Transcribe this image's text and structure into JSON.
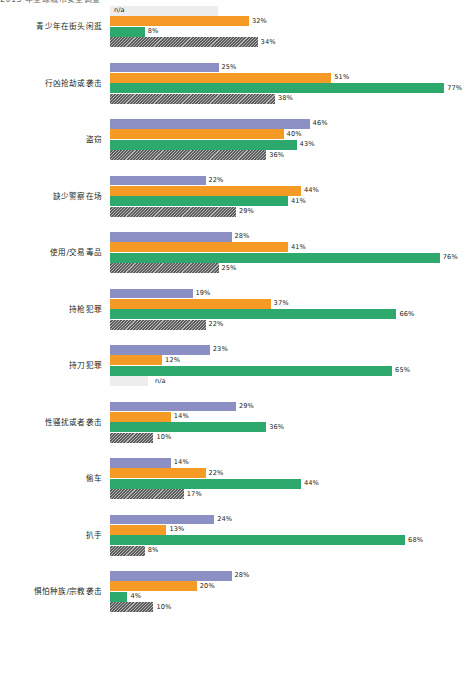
{
  "top_caption": "2013 年全球城市安全调查",
  "chart_data": {
    "type": "bar",
    "orientation": "horizontal-grouped",
    "title": "",
    "subtitle": "",
    "xlabel": "",
    "ylabel": "",
    "xlim": [
      0,
      80
    ],
    "grid": false,
    "legend_position": "none",
    "value_suffix": "%",
    "na_label": "n/a",
    "series": [
      {
        "name": "series-1",
        "color": "#8b8fc4",
        "style": "solid",
        "values": [
          null,
          25,
          46,
          22,
          28,
          19,
          23,
          29,
          14,
          24,
          28
        ]
      },
      {
        "name": "series-2",
        "color": "#f59a25",
        "style": "solid",
        "values": [
          32,
          51,
          40,
          44,
          41,
          37,
          12,
          14,
          22,
          13,
          20
        ]
      },
      {
        "name": "series-3",
        "color": "#2ea96e",
        "style": "solid",
        "values": [
          8,
          77,
          43,
          41,
          76,
          66,
          65,
          36,
          44,
          68,
          4
        ]
      },
      {
        "name": "series-4",
        "color": "#5d5d5d",
        "style": "hatched",
        "values": [
          34,
          38,
          36,
          29,
          25,
          22,
          null,
          10,
          17,
          8,
          10
        ]
      }
    ],
    "categories": [
      "青少年在街头闲逛",
      "行凶抢劫或袭击",
      "盗窃",
      "缺少警察在场",
      "使用/交易毒品",
      "持枪犯罪",
      "持刀犯罪",
      "性骚扰或者袭击",
      "偷车",
      "扒手",
      "惧怕种族/宗教袭击"
    ],
    "labels": [
      [
        "n/a",
        "32%",
        "8%",
        "34%"
      ],
      [
        "25%",
        "51%",
        "77%",
        "38%"
      ],
      [
        "46%",
        "40%",
        "43%",
        "36%"
      ],
      [
        "22%",
        "44%",
        "41%",
        "29%"
      ],
      [
        "28%",
        "41%",
        "76%",
        "25%"
      ],
      [
        "19%",
        "37%",
        "66%",
        "22%"
      ],
      [
        "23%",
        "12%",
        "65%",
        "n/a"
      ],
      [
        "29%",
        "14%",
        "36%",
        "10%"
      ],
      [
        "14%",
        "22%",
        "44%",
        "17%"
      ],
      [
        "24%",
        "13%",
        "68%",
        "8%"
      ],
      [
        "28%",
        "20%",
        "4%",
        "10%"
      ]
    ]
  },
  "colors": {
    "series_1": "#8b8fc4",
    "series_2": "#f59a25",
    "series_3": "#2ea96e",
    "series_4": "#5d5d5d",
    "na_bar": "#ededee",
    "background": "#ffffff",
    "text": "#231f20"
  }
}
